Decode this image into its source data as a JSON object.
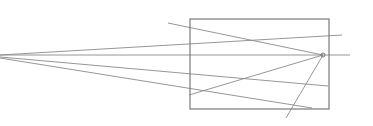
{
  "diagram": {
    "type": "perspective-line-sketch",
    "width": 373,
    "height": 126,
    "background": "#ffffff",
    "stroke_color": "#8a8a8a",
    "frame_color": "#7a7a7a",
    "frame": {
      "x": 190,
      "y": 19,
      "width": 139,
      "height": 90
    },
    "vanishing_point": {
      "x": 323,
      "y": 55,
      "r": 2
    },
    "lines": [
      {
        "id": "horizon",
        "x1": 0,
        "y1": 55,
        "x2": 350,
        "y2": 55
      },
      {
        "id": "ray-upper",
        "x1": 0,
        "y1": 55,
        "x2": 342,
        "y2": 35
      },
      {
        "id": "ray-lower-1",
        "x1": 0,
        "y1": 57,
        "x2": 328,
        "y2": 86
      },
      {
        "id": "ray-lower-2",
        "x1": 0,
        "y1": 58,
        "x2": 312,
        "y2": 108
      },
      {
        "id": "diag-top-to-vp",
        "x1": 168,
        "y1": 23,
        "x2": 323,
        "y2": 55
      },
      {
        "id": "diag-bottom-to-vp",
        "x1": 189,
        "y1": 95,
        "x2": 323,
        "y2": 55
      },
      {
        "id": "steep-from-vp",
        "x1": 323,
        "y1": 55,
        "x2": 286,
        "y2": 118
      }
    ]
  }
}
